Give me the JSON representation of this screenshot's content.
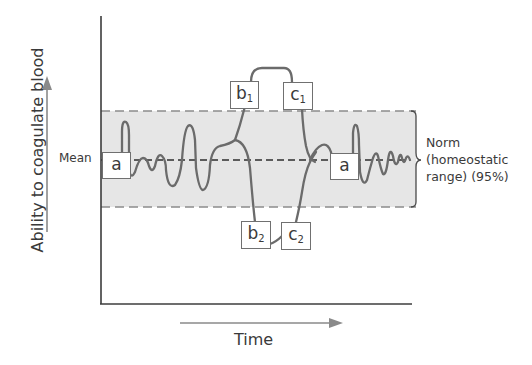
{
  "diagram": {
    "y_axis_label": "Ability to coagulate blood",
    "x_axis_label": "Time",
    "mean_label": "Mean",
    "norm_label": {
      "line1": "Norm",
      "line2": "(homeostatic",
      "line3": "range) (95%)"
    },
    "boxes": [
      {
        "id": "a_left",
        "letter": "a",
        "sub": ""
      },
      {
        "id": "b1",
        "letter": "b",
        "sub": "1"
      },
      {
        "id": "c1",
        "letter": "c",
        "sub": "1"
      },
      {
        "id": "b2",
        "letter": "b",
        "sub": "2"
      },
      {
        "id": "c2",
        "letter": "c",
        "sub": "2"
      },
      {
        "id": "a_right",
        "letter": "a",
        "sub": ""
      }
    ],
    "colors": {
      "band_fill": "#e6e6e6",
      "band_border": "#8c8c8c",
      "curve": "#6b6b6b",
      "axis": "#3c3c3c",
      "arrow": "#8a8a8a",
      "mean_line": "#2e2e2e"
    }
  }
}
